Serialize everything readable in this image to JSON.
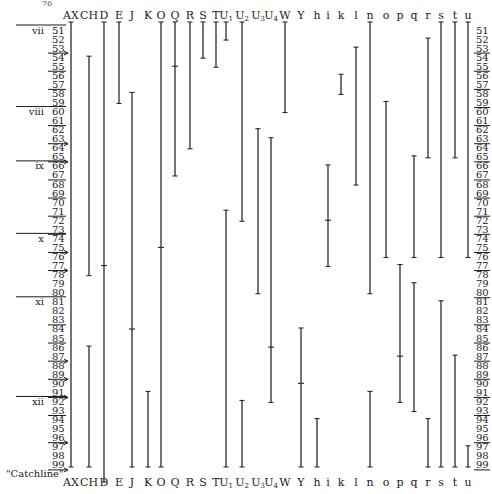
{
  "page_number": "76",
  "catchline_label": "\"Catchline\"",
  "chart_data": {
    "type": "range",
    "title": "",
    "y_axis": {
      "label": "Line",
      "min": 51,
      "max": 99,
      "ticks": [
        51,
        52,
        53,
        54,
        55,
        56,
        57,
        58,
        59,
        60,
        61,
        62,
        63,
        64,
        65,
        66,
        67,
        68,
        69,
        70,
        71,
        72,
        73,
        74,
        75,
        76,
        77,
        78,
        79,
        80,
        81,
        82,
        83,
        84,
        85,
        86,
        87,
        88,
        89,
        90,
        91,
        92,
        93,
        94,
        95,
        96,
        97,
        98,
        99
      ]
    },
    "underlined_rows_left": [
      53,
      55,
      57,
      61,
      63,
      65,
      67,
      69,
      71,
      73,
      75,
      77,
      83,
      85,
      87,
      89,
      91,
      93,
      96,
      99
    ],
    "underlined_rows_right": [
      53,
      55,
      57,
      59,
      61,
      63,
      65,
      67,
      69,
      71,
      73,
      75,
      77,
      80,
      83,
      85,
      87,
      89,
      91,
      93,
      96,
      99
    ],
    "arrow_rows": [
      51,
      53,
      63,
      65,
      75,
      77,
      87,
      89,
      91,
      96,
      99
    ],
    "gatherings": [
      {
        "label": "vii",
        "row": 51
      },
      {
        "label": "viii",
        "row": 60
      },
      {
        "label": "ix",
        "row": 66
      },
      {
        "label": "x",
        "row": 74
      },
      {
        "label": "xi",
        "row": 81
      },
      {
        "label": "xii",
        "row": 92
      }
    ],
    "columns": [
      {
        "label": "AX",
        "sub": "",
        "x": 71,
        "ranges": [
          [
            51,
            99
          ]
        ],
        "marks": []
      },
      {
        "label": "CH",
        "sub": "",
        "x": 89,
        "ranges": [
          [
            54,
            78
          ],
          [
            86,
            99
          ]
        ],
        "marks": []
      },
      {
        "label": "D",
        "sub": "",
        "x": 104,
        "ranges": [
          [
            51,
            100
          ]
        ],
        "marks": [
          77
        ]
      },
      {
        "label": "E",
        "sub": "",
        "x": 119,
        "ranges": [
          [
            51,
            59
          ]
        ],
        "marks": []
      },
      {
        "label": "J",
        "sub": "",
        "x": 132,
        "ranges": [
          [
            58,
            99
          ]
        ],
        "marks": [
          84
        ]
      },
      {
        "label": "K",
        "sub": "",
        "x": 148,
        "ranges": [
          [
            91,
            99
          ]
        ],
        "marks": []
      },
      {
        "label": "O",
        "sub": "",
        "x": 161,
        "ranges": [
          [
            51,
            99
          ]
        ],
        "marks": [
          75
        ]
      },
      {
        "label": "Q",
        "sub": "",
        "x": 175,
        "ranges": [
          [
            51,
            67
          ]
        ],
        "marks": [
          55
        ]
      },
      {
        "label": "R",
        "sub": "",
        "x": 190,
        "ranges": [
          [
            51,
            64
          ]
        ],
        "marks": []
      },
      {
        "label": "S",
        "sub": "",
        "x": 203,
        "ranges": [
          [
            51,
            54
          ]
        ],
        "marks": []
      },
      {
        "label": "T",
        "sub": "",
        "x": 216,
        "ranges": [
          [
            51,
            55
          ]
        ],
        "marks": []
      },
      {
        "label": "U",
        "sub": "1",
        "x": 226,
        "ranges": [
          [
            51,
            52
          ],
          [
            71,
            99
          ]
        ],
        "marks": []
      },
      {
        "label": "U",
        "sub": "2",
        "x": 242,
        "ranges": [
          [
            51,
            72
          ],
          [
            92,
            99
          ]
        ],
        "marks": []
      },
      {
        "label": "U",
        "sub": "3",
        "x": 258,
        "ranges": [
          [
            62,
            80
          ]
        ],
        "marks": []
      },
      {
        "label": "U",
        "sub": "4",
        "x": 271,
        "ranges": [
          [
            63,
            92
          ]
        ],
        "marks": [
          86
        ]
      },
      {
        "label": "W",
        "sub": "",
        "x": 285,
        "ranges": [
          [
            51,
            60
          ]
        ],
        "marks": []
      },
      {
        "label": "Y",
        "sub": "",
        "x": 301,
        "ranges": [
          [
            84,
            99
          ]
        ],
        "marks": [
          90
        ]
      },
      {
        "label": "h",
        "sub": "",
        "x": 317,
        "ranges": [
          [
            94,
            99
          ]
        ],
        "marks": []
      },
      {
        "label": "i",
        "sub": "",
        "x": 328,
        "ranges": [
          [
            66,
            77
          ]
        ],
        "marks": [
          72
        ]
      },
      {
        "label": "k",
        "sub": "",
        "x": 341,
        "ranges": [
          [
            56,
            58
          ]
        ],
        "marks": []
      },
      {
        "label": "l",
        "sub": "",
        "x": 356,
        "ranges": [
          [
            53,
            68
          ]
        ],
        "marks": []
      },
      {
        "label": "n",
        "sub": "",
        "x": 370,
        "ranges": [
          [
            51,
            80
          ],
          [
            91,
            99
          ]
        ],
        "marks": []
      },
      {
        "label": "o",
        "sub": "",
        "x": 386,
        "ranges": [
          [
            59,
            76
          ]
        ],
        "marks": []
      },
      {
        "label": "p",
        "sub": "",
        "x": 400,
        "ranges": [
          [
            77,
            92
          ]
        ],
        "marks": [
          87
        ]
      },
      {
        "label": "q",
        "sub": "",
        "x": 414,
        "ranges": [
          [
            65,
            76
          ],
          [
            79,
            93
          ]
        ],
        "marks": []
      },
      {
        "label": "r",
        "sub": "",
        "x": 428,
        "ranges": [
          [
            52,
            65
          ],
          [
            94,
            99
          ]
        ],
        "marks": []
      },
      {
        "label": "s",
        "sub": "",
        "x": 441,
        "ranges": [
          [
            51,
            76
          ],
          [
            81,
            99
          ]
        ],
        "marks": []
      },
      {
        "label": "t",
        "sub": "",
        "x": 455,
        "ranges": [
          [
            51,
            65
          ],
          [
            87,
            99
          ]
        ],
        "marks": []
      },
      {
        "label": "u",
        "sub": "",
        "x": 468,
        "ranges": [
          [
            51,
            76
          ],
          [
            97,
            99
          ]
        ],
        "marks": []
      }
    ]
  }
}
